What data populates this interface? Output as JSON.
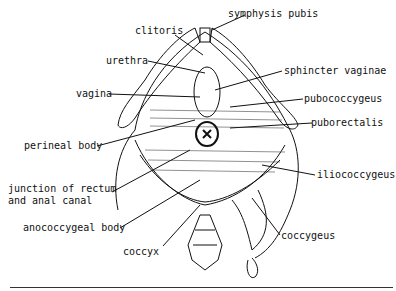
{
  "figure": {
    "labels": {
      "clitoris": "clitoris",
      "symphysis_pubis": "symphysis pubis",
      "urethra": "urethra",
      "sphincter_vaginae": "sphincter vaginae",
      "vagina": "vagina",
      "pubococcygeus": "pubococcygeus",
      "puborectalis": "puborectalis",
      "perineal_body": "perineal body",
      "iliococcygeus": "iliococcygeus",
      "junction_line1": "junction of rectum",
      "junction_line2": "and anal canal",
      "anococcygeal_body": "anococcygeal body",
      "coccygeus": "coccygeus",
      "coccyx": "coccyx"
    },
    "colors": {
      "ink": "#111111",
      "background": "#ffffff"
    }
  }
}
